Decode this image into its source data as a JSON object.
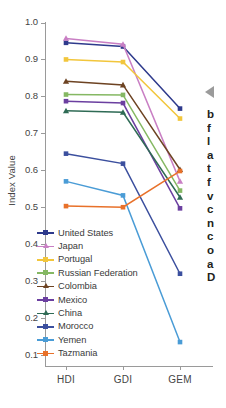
{
  "chart_data": {
    "type": "line",
    "title": "",
    "xlabel": "",
    "ylabel": "Index Value",
    "categories": [
      "HDI",
      "GDI",
      "GEM"
    ],
    "ylim": [
      0.1,
      1.0
    ],
    "yticks": [
      "1.0",
      "0.9",
      "0.8",
      "0.7",
      "0.6",
      "0.5",
      "0.4",
      "0.3",
      "0.2",
      "0.1"
    ],
    "ytick_values": [
      1.0,
      0.9,
      0.8,
      0.7,
      0.6,
      0.5,
      0.4,
      0.3,
      0.2,
      0.1
    ],
    "grid": false,
    "legend_position": "lower-left-inside",
    "series": [
      {
        "name": "United States",
        "values": [
          0.945,
          0.935,
          0.767
        ],
        "color": "#2e3a8c",
        "marker": "square"
      },
      {
        "name": "Japan",
        "values": [
          0.957,
          0.941,
          0.57
        ],
        "color": "#c97fc4",
        "marker": "triangle"
      },
      {
        "name": "Portugal",
        "values": [
          0.9,
          0.893,
          0.74
        ],
        "color": "#f2c63c",
        "marker": "square"
      },
      {
        "name": "Russian Federation",
        "values": [
          0.805,
          0.804,
          0.545
        ],
        "color": "#85b863",
        "marker": "square"
      },
      {
        "name": "Colombia",
        "values": [
          0.841,
          0.831,
          0.602
        ],
        "color": "#6d4322",
        "marker": "triangle"
      },
      {
        "name": "Mexico",
        "values": [
          0.787,
          0.782,
          0.497
        ],
        "color": "#6b3fa0",
        "marker": "square"
      },
      {
        "name": "China",
        "values": [
          0.761,
          0.757,
          0.527
        ],
        "color": "#2f6b55",
        "marker": "triangle"
      },
      {
        "name": "Morocco",
        "values": [
          0.645,
          0.618,
          0.32
        ],
        "color": "#3b4f9e",
        "marker": "square"
      },
      {
        "name": "Yemen",
        "values": [
          0.57,
          0.532,
          0.135
        ],
        "color": "#4a9cd6",
        "marker": "square"
      },
      {
        "name": "Tazmania",
        "values": [
          0.503,
          0.5,
          0.598
        ],
        "color": "#e8712a",
        "marker": "square"
      }
    ]
  },
  "side_text": {
    "lines": [
      "b",
      "f",
      "l",
      "a",
      "t",
      "f",
      "v",
      "c",
      "n",
      "c",
      "o",
      "a",
      "D"
    ]
  }
}
